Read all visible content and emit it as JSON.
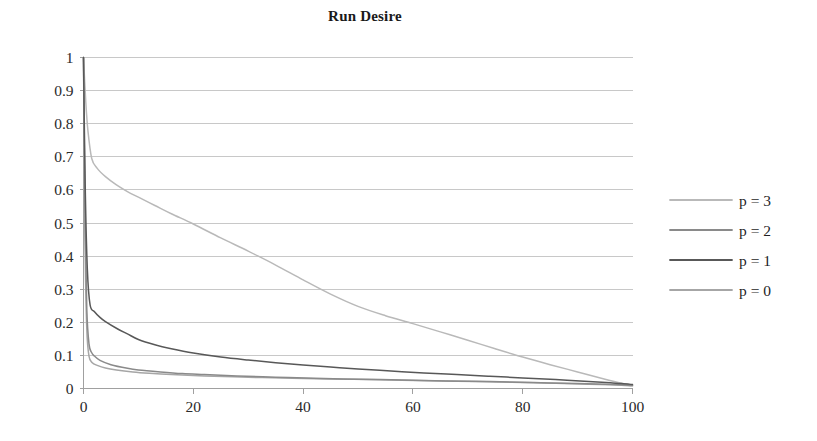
{
  "chart_data": {
    "type": "line",
    "title": "Run Desire",
    "xlabel": "",
    "ylabel": "",
    "xlim": [
      0,
      100
    ],
    "ylim": [
      0,
      1
    ],
    "grid": true,
    "grid_axis": "y",
    "legend_position": "right",
    "x_ticks": [
      "0",
      "20",
      "40",
      "60",
      "80",
      "100"
    ],
    "x_tick_values": [
      0,
      20,
      40,
      60,
      80,
      100
    ],
    "y_ticks": [
      "0",
      "0.1",
      "0.2",
      "0.3",
      "0.4",
      "0.5",
      "0.6",
      "0.7",
      "0.8",
      "0.9",
      "1"
    ],
    "y_tick_values": [
      0,
      0.1,
      0.2,
      0.3,
      0.4,
      0.5,
      0.6,
      0.7,
      0.8,
      0.9,
      1
    ],
    "series": [
      {
        "name": "p = 3",
        "color": "#b9b9b9",
        "x": [
          0,
          0.4,
          0.8,
          1.5,
          2.5,
          4,
          6,
          8,
          10,
          13,
          16,
          20,
          25,
          30,
          35,
          40,
          45,
          50,
          55,
          60,
          65,
          70,
          75,
          80,
          85,
          90,
          95,
          98,
          100
        ],
        "values": [
          1,
          0.87,
          0.78,
          0.695,
          0.665,
          0.64,
          0.615,
          0.595,
          0.578,
          0.553,
          0.528,
          0.497,
          0.455,
          0.415,
          0.373,
          0.328,
          0.285,
          0.248,
          0.22,
          0.196,
          0.171,
          0.146,
          0.12,
          0.095,
          0.072,
          0.05,
          0.028,
          0.016,
          0.01
        ]
      },
      {
        "name": "p = 2",
        "color": "#8a8a8a",
        "x": [
          0,
          0.3,
          0.6,
          1,
          1.5,
          2,
          3,
          5,
          8,
          10,
          14,
          18,
          22,
          28,
          35,
          42,
          50,
          58,
          66,
          74,
          82,
          90,
          95,
          98,
          100
        ],
        "values": [
          1,
          0.5,
          0.24,
          0.135,
          0.108,
          0.098,
          0.085,
          0.072,
          0.061,
          0.056,
          0.05,
          0.045,
          0.042,
          0.038,
          0.034,
          0.031,
          0.028,
          0.026,
          0.023,
          0.021,
          0.018,
          0.015,
          0.013,
          0.011,
          0.009
        ]
      },
      {
        "name": "p = 1",
        "color": "#585858",
        "x": [
          0,
          0.3,
          0.7,
          1.2,
          2,
          3,
          4,
          6,
          8,
          10,
          13,
          16,
          20,
          25,
          30,
          35,
          40,
          45,
          50,
          56,
          62,
          68,
          74,
          80,
          86,
          92,
          96,
          98,
          100
        ],
        "values": [
          1,
          0.62,
          0.36,
          0.253,
          0.232,
          0.215,
          0.202,
          0.182,
          0.165,
          0.148,
          0.132,
          0.12,
          0.107,
          0.095,
          0.086,
          0.078,
          0.071,
          0.065,
          0.059,
          0.053,
          0.047,
          0.042,
          0.037,
          0.032,
          0.027,
          0.021,
          0.017,
          0.015,
          0.012
        ]
      },
      {
        "name": "p = 0",
        "color": "#a6a6a6",
        "x": [
          0,
          0.3,
          0.6,
          1,
          1.6,
          2.5,
          4,
          6,
          9,
          12,
          16,
          22,
          30,
          38,
          48,
          58,
          68,
          78,
          86,
          92,
          96,
          98,
          100
        ],
        "values": [
          1,
          0.42,
          0.18,
          0.098,
          0.078,
          0.07,
          0.062,
          0.056,
          0.05,
          0.046,
          0.042,
          0.038,
          0.034,
          0.031,
          0.028,
          0.025,
          0.022,
          0.019,
          0.016,
          0.013,
          0.011,
          0.01,
          0.008
        ]
      }
    ]
  },
  "legend": {
    "items": [
      {
        "label": "p = 3"
      },
      {
        "label": "p = 2"
      },
      {
        "label": "p = 1"
      },
      {
        "label": "p = 0"
      }
    ]
  },
  "colors": {
    "gridline": "#c8c8c8",
    "axis": "#a0a0a0",
    "text": "#1a1a1a",
    "background": "#ffffff"
  }
}
